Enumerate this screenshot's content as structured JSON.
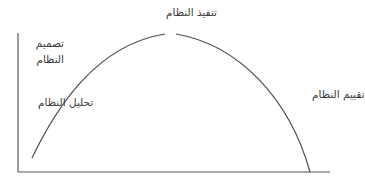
{
  "diagram": {
    "type": "system-development-life-cycle-curve",
    "colors": {
      "line": "#4a4a4a",
      "text": "#3a3a3a",
      "background": "#ffffff"
    },
    "stages": {
      "analysis": "تحليل النظام",
      "design_line1": "تصميم",
      "design_line2": "النظام",
      "implementation": "تنفيذ النظام",
      "evaluation": "تقييم النظام"
    }
  }
}
